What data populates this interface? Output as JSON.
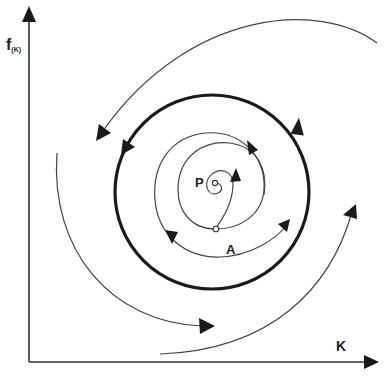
{
  "diagram": {
    "type": "phase-portrait",
    "axes": {
      "y_label_main": "f",
      "y_label_sub": "(K)",
      "x_label": "K"
    },
    "points": {
      "p_label": "P",
      "a_label": "A"
    },
    "elements": [
      {
        "name": "limit-cycle",
        "style": "thick",
        "direction": "counter-clockwise"
      },
      {
        "name": "inner-spiral",
        "from": "P",
        "through": "A",
        "direction": "outward"
      },
      {
        "name": "outer-trajectory-top",
        "direction": "inward"
      },
      {
        "name": "outer-trajectory-left",
        "direction": "inward"
      },
      {
        "name": "outer-trajectory-bottom-right",
        "direction": "inward"
      }
    ],
    "colors": {
      "line": "#1a1a1a",
      "thin_line": "#555555",
      "background": "#ffffff"
    }
  }
}
